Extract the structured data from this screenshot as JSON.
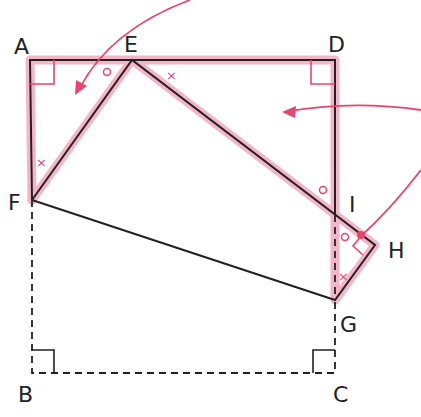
{
  "diagram": {
    "type": "geometry-fold",
    "colors": {
      "line": "#222222",
      "highlight": "#f4a9bd",
      "accent": "#e8456e"
    },
    "labels": {
      "A": "A",
      "E": "E",
      "D": "D",
      "F": "F",
      "I": "I",
      "H": "H",
      "G": "G",
      "B": "B",
      "C": "C"
    },
    "angle_marks": {
      "circle": "○",
      "cross": "×"
    },
    "right_angles": [
      "A",
      "D",
      "H",
      "B",
      "C"
    ]
  }
}
